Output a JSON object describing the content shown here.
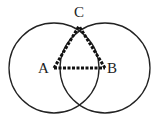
{
  "diagram": {
    "title": "",
    "points": [
      {
        "label": "A",
        "x": 54,
        "y": 68
      },
      {
        "label": "B",
        "x": 105,
        "y": 68
      },
      {
        "label": "C",
        "x": 79,
        "y": 26
      }
    ],
    "circles": [
      {
        "center": "A",
        "cx": 54,
        "cy": 68,
        "r": 45
      },
      {
        "center": "B",
        "cx": 105,
        "cy": 68,
        "r": 45
      }
    ],
    "segments": [
      {
        "from": "A",
        "to": "B",
        "style": "dashed"
      },
      {
        "from": "A",
        "to": "C",
        "style": "dashed"
      },
      {
        "from": "B",
        "to": "C",
        "style": "dashed"
      }
    ],
    "colors": {
      "stroke": "#222222",
      "background": "#ffffff"
    }
  }
}
